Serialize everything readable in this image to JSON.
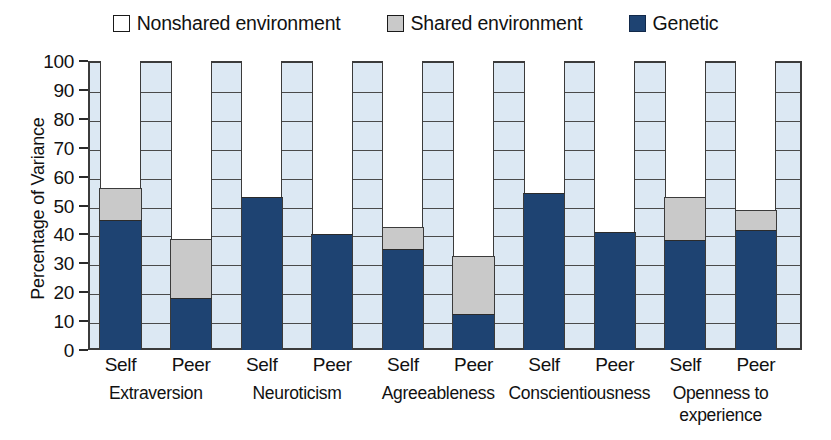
{
  "legend": {
    "items": [
      {
        "label": "Nonshared environment",
        "swatch": "nonshared",
        "color": "#ffffff"
      },
      {
        "label": "Shared environment",
        "swatch": "shared",
        "color": "#c9c9c9"
      },
      {
        "label": "Genetic",
        "swatch": "genetic",
        "color": "#1e4372"
      }
    ]
  },
  "axes": {
    "ylabel": "Percentage of Variance",
    "yticks": [
      "0",
      "10",
      "20",
      "30",
      "40",
      "50",
      "60",
      "70",
      "80",
      "90",
      "100"
    ],
    "ylim": [
      0,
      100
    ]
  },
  "chart_data": {
    "type": "bar",
    "title": "",
    "subtitle": "",
    "xlabel": "",
    "ylabel": "Percentage of Variance",
    "ylim": [
      0,
      100
    ],
    "ytick_step": 10,
    "grid": true,
    "stacked": true,
    "legend_position": "top-center",
    "groups": [
      {
        "name": "Extraversion",
        "raters": [
          "Self",
          "Peer"
        ]
      },
      {
        "name": "Neuroticism",
        "raters": [
          "Self",
          "Peer"
        ]
      },
      {
        "name": "Agreeableness",
        "raters": [
          "Self",
          "Peer"
        ]
      },
      {
        "name": "Conscientiousness",
        "raters": [
          "Self",
          "Peer"
        ]
      },
      {
        "name": "Openness to experience",
        "raters": [
          "Self",
          "Peer"
        ]
      }
    ],
    "categories": [
      "Extraversion Self",
      "Extraversion Peer",
      "Neuroticism Self",
      "Neuroticism Peer",
      "Agreeableness Self",
      "Agreeableness Peer",
      "Conscientiousness Self",
      "Conscientiousness Peer",
      "Openness to experience Self",
      "Openness to experience Peer"
    ],
    "series": [
      {
        "name": "Genetic",
        "color": "#1e4372",
        "values": [
          45,
          18,
          53,
          40,
          35,
          12.5,
          54.5,
          41,
          38,
          41.5
        ]
      },
      {
        "name": "Shared environment",
        "color": "#c9c9c9",
        "values": [
          11,
          20.5,
          0,
          0,
          7.5,
          20,
          0,
          0,
          15,
          7
        ]
      },
      {
        "name": "Nonshared environment",
        "color": "#ffffff",
        "values": [
          44,
          61.5,
          47,
          60,
          57.5,
          67.5,
          45.5,
          59,
          47,
          51.5
        ]
      }
    ],
    "cumulative_tops": {
      "genetic": [
        45,
        18,
        53,
        40,
        35,
        12.5,
        54.5,
        41,
        38,
        41.5
      ],
      "shared": [
        56,
        38.5,
        53,
        40,
        42.5,
        32.5,
        54.5,
        41,
        53,
        48.5
      ]
    }
  },
  "colors": {
    "genetic": "#1e4372",
    "shared": "#c9c9c9",
    "nonshared": "#ffffff",
    "plot_background": "#dce8f3",
    "axis": "#3b3b3b"
  }
}
